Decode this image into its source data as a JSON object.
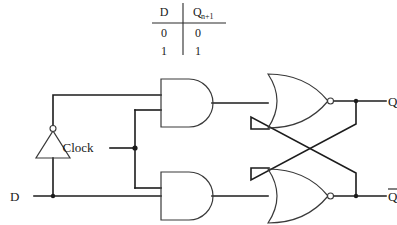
{
  "figure": {
    "name": "d-flip-flop-logic-diagram",
    "background_color": "#ffffff",
    "line_color": "#1c1c1c",
    "gate_outline_color": "#3a3a3a"
  },
  "truth_table": {
    "headers": [
      "D",
      "Q"
    ],
    "header_subscript": "n+1",
    "rows": [
      {
        "d": "0",
        "q": "0"
      },
      {
        "d": "1",
        "q": "1"
      }
    ]
  },
  "circuit": {
    "inputs": [
      {
        "id": "d-input",
        "label": "D"
      },
      {
        "id": "clock-input",
        "label": "Clock"
      }
    ],
    "outputs": [
      {
        "id": "q-output",
        "label": "Q",
        "overbar": false
      },
      {
        "id": "q-bar-output",
        "label": "Q",
        "overbar": true
      }
    ],
    "gates": [
      {
        "id": "inverter",
        "type": "NOT",
        "label": ""
      },
      {
        "id": "and-gate-top",
        "type": "AND",
        "label": ""
      },
      {
        "id": "and-gate-bottom",
        "type": "AND",
        "label": ""
      },
      {
        "id": "nor-gate-top",
        "type": "NOR",
        "label": ""
      },
      {
        "id": "nor-gate-bottom",
        "type": "NOR",
        "label": ""
      }
    ]
  }
}
